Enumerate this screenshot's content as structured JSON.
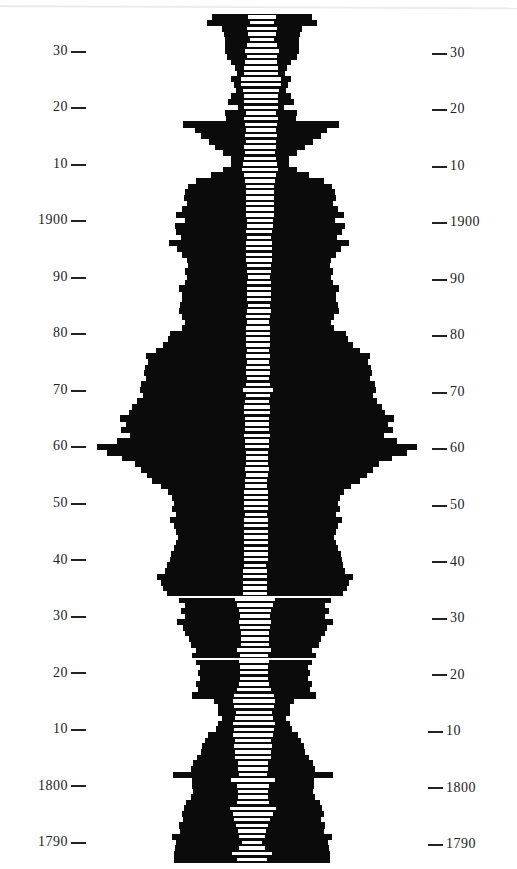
{
  "chart_data": {
    "type": "bar",
    "orientation": "horizontal-symmetric",
    "title": "",
    "xlabel": "",
    "ylabel": "",
    "y_ticks_left": [
      "30",
      "20",
      "10",
      "1900",
      "90",
      "80",
      "70",
      "60",
      "50",
      "40",
      "30",
      "20",
      "10",
      "1800",
      "1790"
    ],
    "y_ticks_right": [
      "30",
      "20",
      "10",
      "1900",
      "90",
      "80",
      "70",
      "60",
      "50",
      "40",
      "30",
      "20",
      "10",
      "1800",
      "1790"
    ],
    "tick_years": [
      1930,
      1920,
      1910,
      1900,
      1890,
      1880,
      1870,
      1860,
      1850,
      1840,
      1830,
      1820,
      1810,
      1800,
      1790
    ],
    "year_range": [
      1787,
      1936
    ],
    "gaps_after_years": [
      1834,
      1823
    ],
    "series": [
      {
        "name": "outer (black)",
        "color": "#0b0b0b",
        "values": [
          50,
          55,
          40,
          38,
          37,
          37,
          37,
          35,
          30,
          26,
          24,
          30,
          27,
          25,
          30,
          33,
          23,
          36,
          35,
          78,
          66,
          60,
          52,
          45,
          37,
          29,
          29,
          37,
          49,
          64,
          72,
          75,
          76,
          73,
          78,
          84,
          75,
          85,
          83,
          78,
          90,
          82,
          77,
          72,
          71,
          74,
          72,
          74,
          80,
          77,
          77,
          79,
          80,
          76,
          73,
          76,
          88,
          90,
          95,
          102,
          112,
          110,
          113,
          114,
          112,
          117,
          118,
          115,
          120,
          125,
          128,
          137,
          131,
          136,
          127,
          140,
          160,
          150,
          135,
          122,
          116,
          110,
          104,
          95,
          88,
          84,
          82,
          84,
          80,
          86,
          82,
          80,
          78,
          80,
          82,
          85,
          86,
          88,
          90,
          98,
          94,
          92,
          88,
          76,
          70,
          74,
          70,
          78,
          72,
          70,
          66,
          64,
          58,
          62,
          58,
          54,
          56,
          54,
          58,
          56,
          62,
          40,
          36,
          36,
          32,
          36,
          38,
          45,
          48,
          51,
          52,
          56,
          60,
          62,
          80,
          61,
          61,
          60,
          62,
          67,
          69,
          71,
          69,
          73,
          72,
          80,
          76,
          77,
          78,
          78
        ]
      },
      {
        "name": "inner (white)",
        "color": "#ffffff",
        "values": [
          14,
          12,
          15,
          14,
          12,
          15,
          17,
          15,
          16,
          17,
          17,
          20,
          20,
          18,
          17,
          17,
          17,
          15,
          17,
          16,
          15,
          16,
          15,
          16,
          15,
          16,
          17,
          18,
          16,
          15,
          14,
          14,
          14,
          14,
          14,
          14,
          13,
          13,
          13,
          12,
          13,
          13,
          13,
          13,
          12,
          12,
          11,
          12,
          12,
          12,
          12,
          11,
          12,
          12,
          11,
          12,
          12,
          12,
          12,
          11,
          12,
          11,
          12,
          12,
          11,
          12,
          15,
          12,
          12,
          13,
          13,
          12,
          12,
          12,
          13,
          12,
          12,
          11,
          11,
          11,
          12,
          11,
          11,
          11,
          12,
          12,
          12,
          12,
          11,
          12,
          12,
          12,
          12,
          12,
          12,
          12,
          12,
          11,
          12,
          12,
          12,
          12,
          12,
          20,
          18,
          16,
          15,
          16,
          15,
          14,
          14,
          14,
          17,
          14,
          15,
          14,
          14,
          14,
          15,
          17,
          20,
          21,
          20,
          18,
          19,
          21,
          20,
          20,
          18,
          19,
          18,
          18,
          15,
          15,
          14,
          22,
          16,
          15,
          15,
          16,
          23,
          20,
          18,
          16,
          14,
          13,
          10,
          13,
          20,
          15
        ]
      }
    ],
    "years_top_to_bottom_start": 1936,
    "grid": false,
    "legend": "none"
  },
  "axis": {
    "left_labels": [
      "30",
      "20",
      "10",
      "1900",
      "90",
      "80",
      "70",
      "60",
      "50",
      "40",
      "30",
      "20",
      "10",
      "1800",
      "1790"
    ],
    "right_labels": [
      "30",
      "20",
      "10",
      "1900",
      "90",
      "80",
      "70",
      "60",
      "50",
      "40",
      "30",
      "20",
      "10",
      "1800",
      "1790"
    ]
  },
  "colors": {
    "bar": "#0b0b0b",
    "inner": "#ffffff",
    "background": "#ffffff",
    "text": "#222222"
  }
}
